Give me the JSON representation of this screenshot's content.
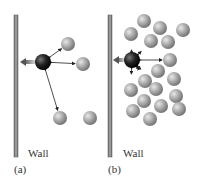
{
  "panels": [
    {
      "id": "a",
      "caption": "(a)",
      "wall_label": "Wall",
      "description": "Molecule colliding with wall; few neighboring molecules (low density)",
      "wall": {
        "x": 14,
        "y": 15,
        "width": 4,
        "height": 142
      },
      "focus_molecule": {
        "x": 43,
        "y": 62,
        "r": 8
      },
      "molecules": [
        {
          "x": 68,
          "y": 44,
          "r": 7
        },
        {
          "x": 83,
          "y": 64,
          "r": 7
        },
        {
          "x": 60,
          "y": 118,
          "r": 7
        },
        {
          "x": 90,
          "y": 118,
          "r": 7
        }
      ],
      "arrows_to": [
        [
          68,
          44
        ],
        [
          83,
          64
        ],
        [
          60,
          118
        ]
      ],
      "force_arrow": {
        "from": [
          36,
          62
        ],
        "to": [
          20,
          62
        ]
      }
    },
    {
      "id": "b",
      "caption": "(b)",
      "wall_label": "Wall",
      "description": "Molecule colliding with wall; many neighboring molecules (high density)",
      "wall": {
        "x": 108,
        "y": 15,
        "width": 4,
        "height": 142
      },
      "focus_molecule": {
        "x": 132,
        "y": 60,
        "r": 8
      },
      "molecules": [
        {
          "x": 144,
          "y": 21,
          "r": 7
        },
        {
          "x": 160,
          "y": 28,
          "r": 7
        },
        {
          "x": 183,
          "y": 30,
          "r": 7
        },
        {
          "x": 131,
          "y": 34,
          "r": 7
        },
        {
          "x": 151,
          "y": 41,
          "r": 7
        },
        {
          "x": 168,
          "y": 42,
          "r": 7
        },
        {
          "x": 170,
          "y": 60,
          "r": 7
        },
        {
          "x": 158,
          "y": 71,
          "r": 7
        },
        {
          "x": 174,
          "y": 79,
          "r": 7
        },
        {
          "x": 145,
          "y": 81,
          "r": 7
        },
        {
          "x": 131,
          "y": 90,
          "r": 7
        },
        {
          "x": 156,
          "y": 89,
          "r": 7
        },
        {
          "x": 176,
          "y": 96,
          "r": 7
        },
        {
          "x": 144,
          "y": 101,
          "r": 7
        },
        {
          "x": 161,
          "y": 106,
          "r": 7
        },
        {
          "x": 179,
          "y": 109,
          "r": 7
        },
        {
          "x": 133,
          "y": 111,
          "r": 7
        },
        {
          "x": 150,
          "y": 119,
          "r": 7
        }
      ],
      "arrows_to": [
        [
          131,
          42
        ],
        [
          147,
          46
        ],
        [
          170,
          60
        ],
        [
          146,
          75
        ],
        [
          131,
          82
        ],
        [
          141,
          72
        ]
      ],
      "force_arrow": {
        "from": [
          125,
          60
        ],
        "to": [
          113,
          60
        ]
      }
    }
  ],
  "colors": {
    "wall": "#888888",
    "wall_edge": "#555555",
    "molecule": "#a8a8a8",
    "focus_molecule": "#1a1a1a",
    "arrow": "#222222",
    "force_arrow": "#6a6a6a"
  }
}
